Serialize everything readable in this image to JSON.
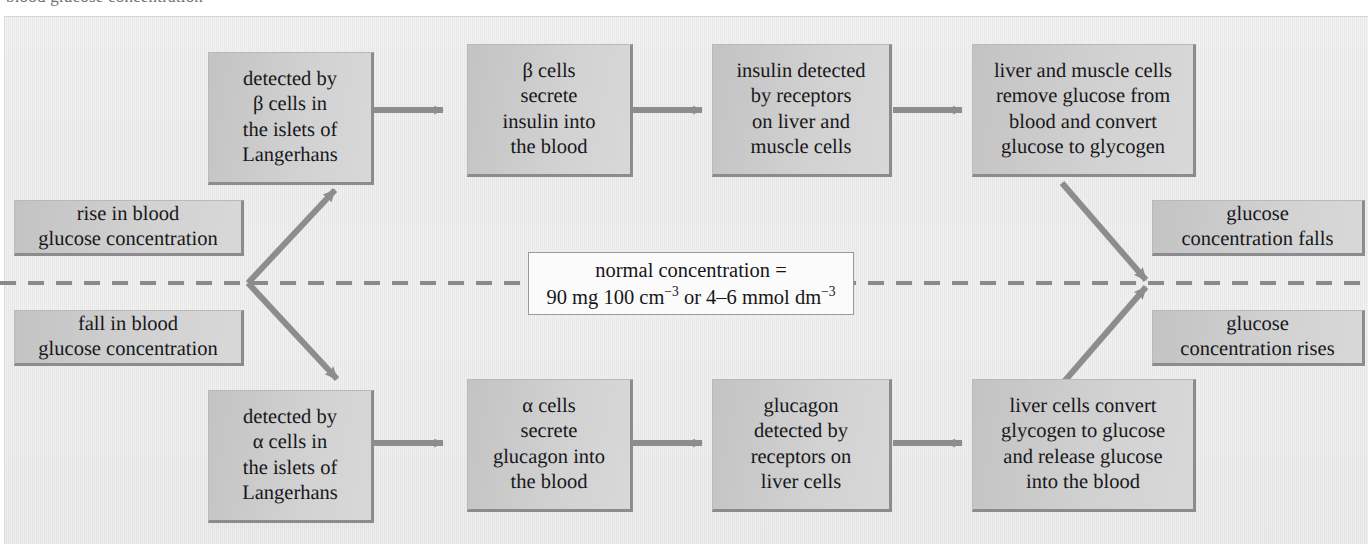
{
  "figure": {
    "cut_off_header_text": "blood glucose concentration",
    "divider": {
      "name": "normal-concentration-dashed-line",
      "style": "dashed",
      "color": "#8a8a8c"
    },
    "accent_colors": {
      "box_fill": "#d2d2d3",
      "box_shadow": "#8c8c8e",
      "arrow": "#8d8d8f",
      "page_background": "#eaeaeb",
      "text": "#18181a"
    }
  },
  "center_label": {
    "name": "normal-concentration-box",
    "line1": "normal concentration =",
    "line2_prefix": "90 mg 100 cm",
    "line2_sup1": "−3",
    "line2_mid": " or 4–6 mmol dm",
    "line2_sup2": "−3",
    "value_mg": "90 mg 100 cm−3",
    "value_mmol": "4–6 mmol dm−3"
  },
  "upper_pathway": {
    "name": "insulin-pathway",
    "trigger": {
      "name": "rise-in-blood-glucose",
      "line1": "rise in blood",
      "line2": "glucose concentration"
    },
    "steps": [
      {
        "name": "step-detected-by-beta-cells",
        "lines": [
          "detected by",
          "β cells in",
          "the islets of",
          "Langerhans"
        ]
      },
      {
        "name": "step-beta-cells-secrete-insulin",
        "lines": [
          "β cells",
          "secrete",
          "insulin into",
          "the blood"
        ]
      },
      {
        "name": "step-insulin-detected-by-receptors",
        "lines": [
          "insulin detected",
          "by receptors",
          "on liver and",
          "muscle cells"
        ]
      },
      {
        "name": "step-cells-remove-glucose",
        "lines": [
          "liver and muscle cells",
          "remove glucose from",
          "blood and convert",
          "glucose to glycogen"
        ]
      }
    ],
    "outcome": {
      "name": "glucose-concentration-falls",
      "line1": "glucose",
      "line2": "concentration falls"
    }
  },
  "lower_pathway": {
    "name": "glucagon-pathway",
    "trigger": {
      "name": "fall-in-blood-glucose",
      "line1": "fall in blood",
      "line2": "glucose concentration"
    },
    "steps": [
      {
        "name": "step-detected-by-alpha-cells",
        "lines": [
          "detected by",
          "α cells in",
          "the islets of",
          "Langerhans"
        ]
      },
      {
        "name": "step-alpha-cells-secrete-glucagon",
        "lines": [
          "α cells",
          "secrete",
          "glucagon into",
          "the blood"
        ]
      },
      {
        "name": "step-glucagon-detected-by-receptors",
        "lines": [
          "glucagon",
          "detected by",
          "receptors on",
          "liver cells"
        ]
      },
      {
        "name": "step-liver-cells-convert-glycogen",
        "lines": [
          "liver cells convert",
          "glycogen to glucose",
          "and release glucose",
          "into the blood"
        ]
      }
    ],
    "outcome": {
      "name": "glucose-concentration-rises",
      "line1": "glucose",
      "line2": "concentration rises"
    }
  }
}
